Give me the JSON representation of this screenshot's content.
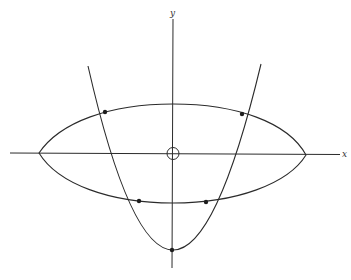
{
  "figure": {
    "type": "ellipse-parabola-intersection",
    "axes": {
      "x_label": "x",
      "y_label": "y",
      "origin_marker": "circle"
    },
    "curves": [
      {
        "name": "ellipse",
        "description": "flattened lens-shaped ellipse centered on origin"
      },
      {
        "name": "parabola",
        "description": "upward-opening parabola with vertex below origin on y-axis"
      }
    ],
    "marked_points": [
      {
        "name": "upper-left-intersection"
      },
      {
        "name": "upper-right-intersection"
      },
      {
        "name": "lower-left-intersection"
      },
      {
        "name": "lower-right-intersection"
      },
      {
        "name": "parabola-vertex"
      }
    ],
    "colors": {
      "stroke": "#2b2b2b",
      "background": "#ffffff"
    }
  }
}
